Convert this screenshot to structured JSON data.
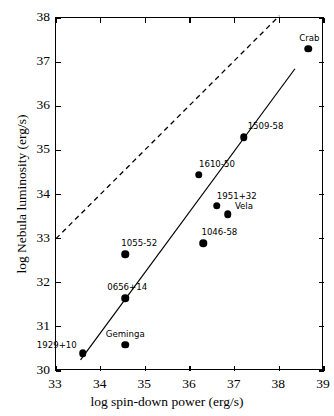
{
  "chart_data": {
    "type": "scatter",
    "title": "",
    "xlabel": "log spin-down power (erg/s)",
    "ylabel": "log Nebula luminosity (erg/s)",
    "xlim": [
      33,
      39
    ],
    "ylim": [
      30,
      38
    ],
    "xticks": [
      "33",
      "34",
      "35",
      "36",
      "37",
      "38",
      "39"
    ],
    "yticks": [
      "30",
      "31",
      "32",
      "33",
      "34",
      "35",
      "36",
      "37",
      "38"
    ],
    "grid": false,
    "legend": "none",
    "points": [
      {
        "label": "1929+10",
        "x": 33.6,
        "y": 30.4,
        "label_dx": -26,
        "label_dy": -8
      },
      {
        "label": "Geminga",
        "x": 34.55,
        "y": 30.6,
        "label_dx": 0,
        "label_dy": -11
      },
      {
        "label": "0656+14",
        "x": 34.55,
        "y": 31.65,
        "label_dx": 2,
        "label_dy": -11
      },
      {
        "label": "1055-52",
        "x": 34.55,
        "y": 32.65,
        "label_dx": 14,
        "label_dy": -11
      },
      {
        "label": "1046-58",
        "x": 36.3,
        "y": 32.9,
        "label_dx": 16,
        "label_dy": -11
      },
      {
        "label": "Vela",
        "x": 36.85,
        "y": 33.55,
        "label_dx": 16,
        "label_dy": -8
      },
      {
        "label": "1951+32",
        "x": 36.6,
        "y": 33.75,
        "label_dx": 20,
        "label_dy": -10
      },
      {
        "label": "1610-50",
        "x": 36.2,
        "y": 34.45,
        "label_dx": 18,
        "label_dy": -11
      },
      {
        "label": "1509-58",
        "x": 37.2,
        "y": 35.3,
        "label_dx": 22,
        "label_dy": -11
      },
      {
        "label": "Crab",
        "x": 38.65,
        "y": 37.3,
        "label_dx": 1,
        "label_dy": -11
      }
    ],
    "lines": [
      {
        "name": "fit-line",
        "style": "solid",
        "x0": 33.55,
        "y0": 30.25,
        "x1": 38.35,
        "y1": 36.85
      },
      {
        "name": "efficiency-line",
        "style": "dashed",
        "x0": 33.0,
        "y0": 33.0,
        "x1": 38.0,
        "y1": 38.05
      }
    ]
  }
}
